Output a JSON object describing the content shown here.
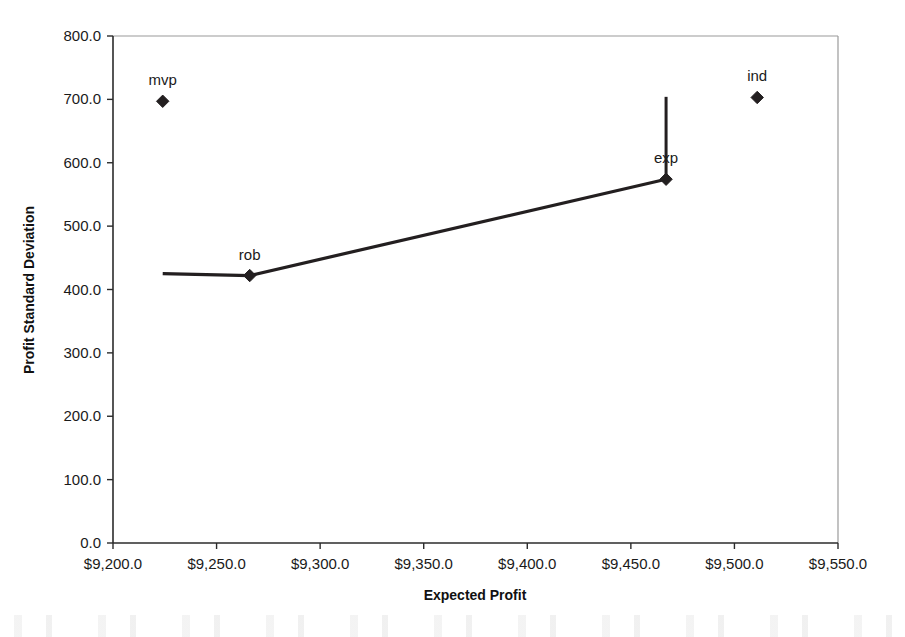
{
  "chart_data": {
    "type": "scatter",
    "title": "",
    "xlabel": "Expected Profit",
    "ylabel": "Profit Standard Deviation",
    "xlim": [
      9200.0,
      9550.0
    ],
    "ylim": [
      0.0,
      800.0
    ],
    "grid": false,
    "legend": false,
    "x_tick_labels": [
      "$9,200.0",
      "$9,250.0",
      "$9,300.0",
      "$9,350.0",
      "$9,400.0",
      "$9,450.0",
      "$9,500.0",
      "$9,550.0"
    ],
    "x_tick_values": [
      9200.0,
      9250.0,
      9300.0,
      9350.0,
      9400.0,
      9450.0,
      9500.0,
      9550.0
    ],
    "y_tick_labels": [
      "0.0",
      "100.0",
      "200.0",
      "300.0",
      "400.0",
      "500.0",
      "600.0",
      "700.0",
      "800.0"
    ],
    "y_tick_values": [
      0.0,
      100.0,
      200.0,
      300.0,
      400.0,
      500.0,
      600.0,
      700.0,
      800.0
    ],
    "points": [
      {
        "label": "mvp",
        "x": 9224.0,
        "y": 697.0,
        "label_dx": 0,
        "label_dy": -16
      },
      {
        "label": "rob",
        "x": 9266.0,
        "y": 422.0,
        "label_dx": 0,
        "label_dy": -16
      },
      {
        "label": "exp",
        "x": 9467.0,
        "y": 574.0,
        "label_dx": 0,
        "label_dy": -16
      },
      {
        "label": "ind",
        "x": 9511.0,
        "y": 703.0,
        "label_dx": 0,
        "label_dy": -16
      }
    ],
    "series": [
      {
        "name": "efficient-frontier",
        "x": [
          9224.0,
          9266.0,
          9467.0
        ],
        "y": [
          425.0,
          422.0,
          574.0
        ]
      }
    ],
    "drop_line": {
      "name": "exp-vertical-line",
      "x": 9467.0,
      "y_from": 574.0,
      "y_to": 704.0
    }
  },
  "axis": {
    "x_title": "Expected Profit",
    "y_title": "Profit Standard Deviation"
  }
}
